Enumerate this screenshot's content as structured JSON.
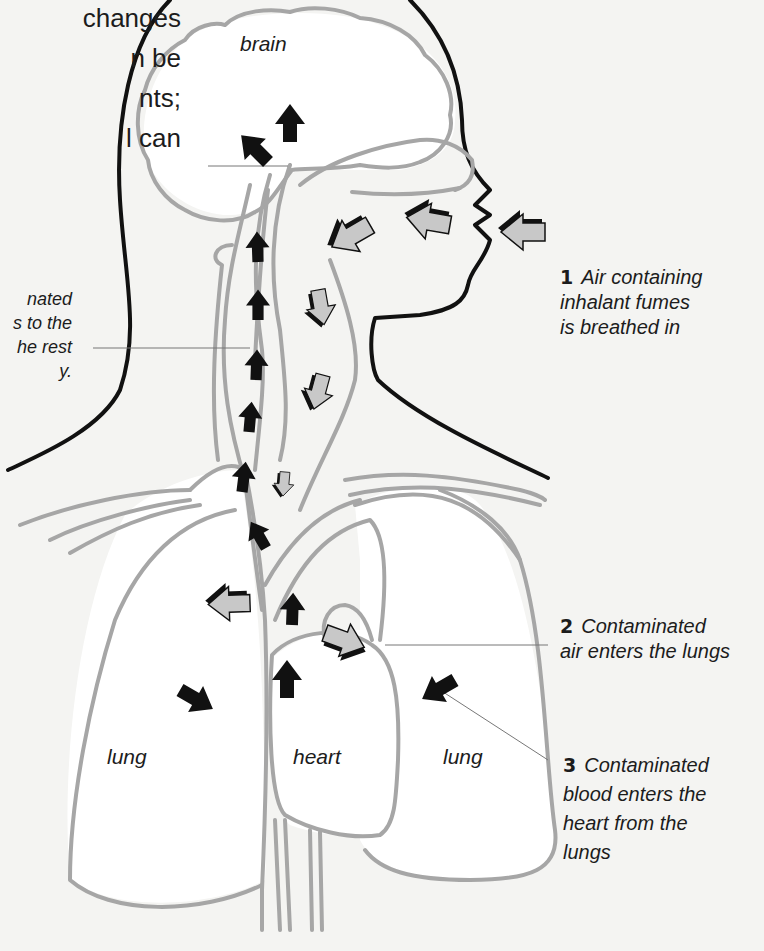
{
  "intro_text": {
    "lines": [
      "changes",
      "n be",
      "nts;",
      "l can"
    ]
  },
  "left_caption": {
    "lines": [
      "nated",
      "s to the",
      "he rest",
      "y."
    ]
  },
  "captions": [
    {
      "number": "1",
      "lines": [
        "Air containing",
        "inhalant fumes",
        "is breathed in"
      ]
    },
    {
      "number": "2",
      "lines": [
        "Contaminated",
        "air enters the lungs"
      ]
    },
    {
      "number": "3",
      "lines": [
        "Contaminated",
        "blood enters the",
        "heart from the",
        "lungs"
      ]
    }
  ],
  "organ_labels": {
    "brain": "brain",
    "lung_left": "lung",
    "heart": "heart",
    "lung_right": "lung"
  },
  "colors": {
    "background": "#f4f4f2",
    "outline_body": "#111111",
    "outline_organs": "#a6a6a6",
    "air_arrow_fill": "#c8c8c8",
    "blood_arrow_fill": "#111111",
    "leader_line": "#777777"
  }
}
